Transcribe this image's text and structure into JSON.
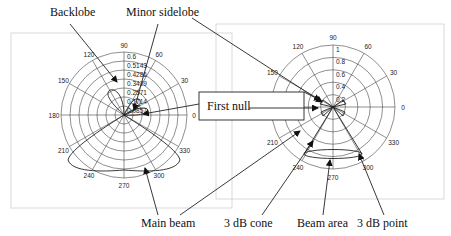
{
  "labels": {
    "backlobe": "Backlobe",
    "minor_sidelobe": "Minor sidelobe",
    "first_null": "First null",
    "main_beam": "Main beam",
    "three_db_cone": "3 dB cone",
    "beam_area": "Beam area",
    "three_db_point": "3 dB point"
  },
  "left_plot": {
    "angle_labels": [
      "0",
      "30",
      "60",
      "90",
      "120",
      "150",
      "180",
      "210",
      "240",
      "270",
      "300",
      "330"
    ],
    "radial_labels": [
      "0.6",
      "0.5143",
      "0.4286",
      "0.3429",
      "0.2571",
      "0.1714",
      "0.0857"
    ]
  },
  "right_plot": {
    "angle_labels": [
      "0",
      "30",
      "60",
      "90",
      "120",
      "150",
      "180",
      "210",
      "240",
      "270",
      "300",
      "330"
    ],
    "radial_labels": [
      "1",
      "0.8",
      "0.6",
      "0.4",
      "0.2"
    ]
  },
  "colors": {
    "ink": "#222222",
    "frame": "#cfcfcf",
    "background": "#ffffff"
  }
}
